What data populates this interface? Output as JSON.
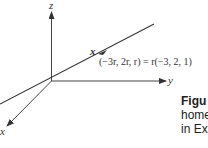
{
  "diagram": {
    "axes": {
      "z_label": "z",
      "y_label": "y",
      "x_label": "x"
    },
    "line_label": "x",
    "equation": "(−3r, 2r, r) = r(−3, 2, 1)",
    "caption": {
      "title": "Figu",
      "line2": "home",
      "line3": "in Ex"
    },
    "colors": {
      "line": "#333333",
      "text": "#333333"
    }
  }
}
